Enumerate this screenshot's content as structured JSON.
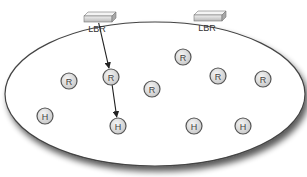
{
  "diagram": {
    "region": {
      "shape": "ellipse",
      "cx": 155,
      "cy": 94,
      "rx": 150,
      "ry": 72,
      "fill": "#ffffff",
      "stroke": "#444444"
    },
    "routers_border": [
      {
        "id": "lbr1",
        "label": "LBR",
        "x": 98,
        "y": 20
      },
      {
        "id": "lbr2",
        "label": "LBR",
        "x": 208,
        "y": 19
      }
    ],
    "nodes": [
      {
        "id": "r1",
        "label": "R",
        "type": "router",
        "x": 69,
        "y": 81
      },
      {
        "id": "r2",
        "label": "R",
        "type": "router",
        "x": 111,
        "y": 77
      },
      {
        "id": "r3",
        "label": "R",
        "type": "router",
        "x": 152,
        "y": 89
      },
      {
        "id": "r4",
        "label": "R",
        "type": "router",
        "x": 183,
        "y": 57
      },
      {
        "id": "r5",
        "label": "R",
        "type": "router",
        "x": 218,
        "y": 76
      },
      {
        "id": "r6",
        "label": "R",
        "type": "router",
        "x": 263,
        "y": 79
      },
      {
        "id": "h1",
        "label": "H",
        "type": "host",
        "x": 45,
        "y": 116
      },
      {
        "id": "h2",
        "label": "H",
        "type": "host",
        "x": 118,
        "y": 126
      },
      {
        "id": "h3",
        "label": "H",
        "type": "host",
        "x": 194,
        "y": 126
      },
      {
        "id": "h4",
        "label": "H",
        "type": "host",
        "x": 243,
        "y": 126
      }
    ],
    "edges": [
      {
        "from": "lbr1",
        "to": "r2",
        "directed": true
      },
      {
        "from": "r2",
        "to": "h2",
        "directed": true
      }
    ],
    "colors": {
      "node_fill": "#dcdcdc",
      "node_stroke": "#555555",
      "edge": "#222222",
      "shadow": "#777777"
    }
  }
}
